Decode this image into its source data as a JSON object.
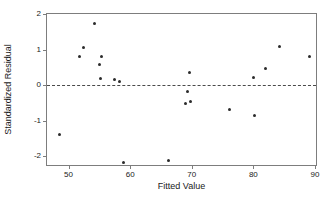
{
  "chart_data": {
    "type": "scatter",
    "title": "",
    "subtitle": "",
    "xlabel": "Fitted Value",
    "ylabel": "Standardized Residual",
    "xlim": [
      46.5,
      90.5
    ],
    "ylim": [
      -2.3,
      2.0
    ],
    "xticks": [
      50,
      60,
      70,
      80,
      90
    ],
    "yticks": [
      2,
      1,
      0,
      -1,
      -2
    ],
    "xtick_labels": [
      "50",
      "60",
      "70",
      "80",
      "90"
    ],
    "ytick_labels": [
      "2",
      "1",
      "0",
      "-1",
      "-2"
    ],
    "grid": false,
    "legend": null,
    "marker": "filled-circle",
    "marker_color": "#2b2b2b",
    "frame_color": "#7d7d7d",
    "reference_line": {
      "orientation": "horizontal",
      "y": 0,
      "style": "dashed",
      "color": "#4a4a4a"
    },
    "points": [
      {
        "x": 48.6,
        "y": -1.38
      },
      {
        "x": 51.8,
        "y": 0.8
      },
      {
        "x": 52.4,
        "y": 1.07
      },
      {
        "x": 54.2,
        "y": 1.72
      },
      {
        "x": 55.1,
        "y": 0.58
      },
      {
        "x": 55.4,
        "y": 0.81
      },
      {
        "x": 55.2,
        "y": 0.19
      },
      {
        "x": 57.4,
        "y": 0.15
      },
      {
        "x": 58.2,
        "y": 0.09
      },
      {
        "x": 59.0,
        "y": -2.17
      },
      {
        "x": 66.3,
        "y": -2.12
      },
      {
        "x": 69.0,
        "y": -0.52
      },
      {
        "x": 69.3,
        "y": -0.19
      },
      {
        "x": 69.7,
        "y": 0.36
      },
      {
        "x": 69.8,
        "y": -0.46
      },
      {
        "x": 76.2,
        "y": -0.67
      },
      {
        "x": 80.1,
        "y": 0.22
      },
      {
        "x": 80.2,
        "y": -0.86
      },
      {
        "x": 82.0,
        "y": 0.47
      },
      {
        "x": 84.3,
        "y": 1.09
      },
      {
        "x": 89.1,
        "y": 0.81
      }
    ]
  }
}
